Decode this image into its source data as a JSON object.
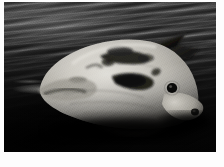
{
  "image": {
    "kind": "photograph",
    "medium": "black-and-white photographic print with white border",
    "caption": "An ocean sunfish (Mola mola) floating at the surface of dark, rippled seawater",
    "alt_text": "Grainy monochrome photo of a large pale sunfish lying on its side at the water surface, dorsal fin angled to the upper right, dark eye visible on the right flank, surrounded by dark wind-ruffled water",
    "orientation": "landscape",
    "border_color": "#fdfdfd"
  },
  "scene": {
    "subject": "ocean sunfish",
    "setting": "open sea surface",
    "time_of_day": "daylight",
    "palette": {
      "water_highlight": "#4a4a4a",
      "water_mid": "#262626",
      "water_shadow": "#040404",
      "fish_highlight": "#e8e6e0",
      "fish_midtone": "#b9b6ae",
      "fish_shadow": "#6d6b65",
      "dark_markings": "#141414",
      "foam": "#d2d2cd"
    }
  },
  "elements": {
    "water": "sea-surface",
    "wave_ripples": "diagonal wind ripples running lower-left to upper-right",
    "wake": "pale foam streak left of the fish",
    "fish_body": "broad oval pale body",
    "dorsal_fin": "tall dark fin angled up and back at the upper right",
    "anal_fin": "lower fin submerged at bottom centre",
    "eye": "small round dark eye on the right flank",
    "mouth": "small dark puckered mouth at the snout tip",
    "blotches": "dark mottled patches across the upper body"
  }
}
